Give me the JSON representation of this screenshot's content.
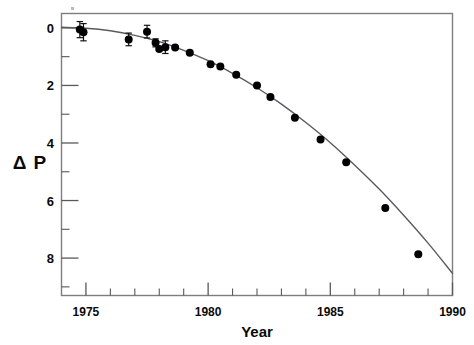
{
  "figure": {
    "title": "",
    "background": "#ffffff",
    "frame_color": "#7d7d82",
    "point_color": "#000000",
    "curve_color": "#5a5a60"
  },
  "axes": {
    "y_title": "Δ P",
    "x_title": "Year",
    "y_tick_labels": [
      "0",
      "2",
      "4",
      "6",
      "8"
    ],
    "x_tick_labels": [
      "1975",
      "1980",
      "1985",
      "1990"
    ]
  },
  "chart_data": {
    "type": "scatter",
    "title": "",
    "xlabel": "Year",
    "ylabel": "Δ P",
    "xlim": [
      1974.0,
      1990.0
    ],
    "ylim": [
      -0.5,
      9.3
    ],
    "y_axis_inverted": true,
    "xticks": [
      1975,
      1980,
      1985,
      1990
    ],
    "xticks_minor": [
      1976,
      1977,
      1978,
      1979,
      1981,
      1982,
      1983,
      1984,
      1986,
      1987,
      1988,
      1989
    ],
    "yticks": [
      0,
      2,
      4,
      6,
      8
    ],
    "grid": false,
    "legend": null,
    "series": [
      {
        "name": "Model (general relativity prediction)",
        "type": "line",
        "x": [
          1974.0,
          1975.0,
          1976.0,
          1977.0,
          1978.0,
          1979.0,
          1980.0,
          1981.0,
          1982.0,
          1983.0,
          1984.0,
          1985.0,
          1986.0,
          1987.0,
          1988.0,
          1989.0,
          1990.0
        ],
        "y": [
          -0.02,
          0.01,
          0.1,
          0.26,
          0.48,
          0.78,
          1.14,
          1.58,
          2.08,
          2.65,
          3.29,
          3.99,
          4.77,
          5.6,
          6.51,
          7.48,
          8.53
        ]
      },
      {
        "name": "Observed cumulative period shift",
        "type": "scatter",
        "points": [
          {
            "x": 1974.75,
            "y": 0.06,
            "yerr": 0.28
          },
          {
            "x": 1974.9,
            "y": 0.15,
            "yerr": 0.3
          },
          {
            "x": 1976.75,
            "y": 0.4,
            "yerr": 0.22
          },
          {
            "x": 1977.5,
            "y": 0.13,
            "yerr": 0.22
          },
          {
            "x": 1977.85,
            "y": 0.52,
            "yerr": 0.14
          },
          {
            "x": 1978.0,
            "y": 0.73,
            "yerr": 0.0
          },
          {
            "x": 1978.25,
            "y": 0.67,
            "yerr": 0.22
          },
          {
            "x": 1978.65,
            "y": 0.68,
            "yerr": 0.0
          },
          {
            "x": 1979.25,
            "y": 0.86,
            "yerr": 0.0
          },
          {
            "x": 1980.1,
            "y": 1.26,
            "yerr": 0.0
          },
          {
            "x": 1980.5,
            "y": 1.34,
            "yerr": 0.0
          },
          {
            "x": 1981.15,
            "y": 1.63,
            "yerr": 0.0
          },
          {
            "x": 1982.0,
            "y": 2.0,
            "yerr": 0.0
          },
          {
            "x": 1982.55,
            "y": 2.4,
            "yerr": 0.0
          },
          {
            "x": 1983.55,
            "y": 3.12,
            "yerr": 0.0
          },
          {
            "x": 1984.6,
            "y": 3.88,
            "yerr": 0.0
          },
          {
            "x": 1985.65,
            "y": 4.67,
            "yerr": 0.0
          },
          {
            "x": 1987.25,
            "y": 6.26,
            "yerr": 0.0
          },
          {
            "x": 1988.6,
            "y": 7.87,
            "yerr": 0.0
          }
        ]
      }
    ]
  }
}
